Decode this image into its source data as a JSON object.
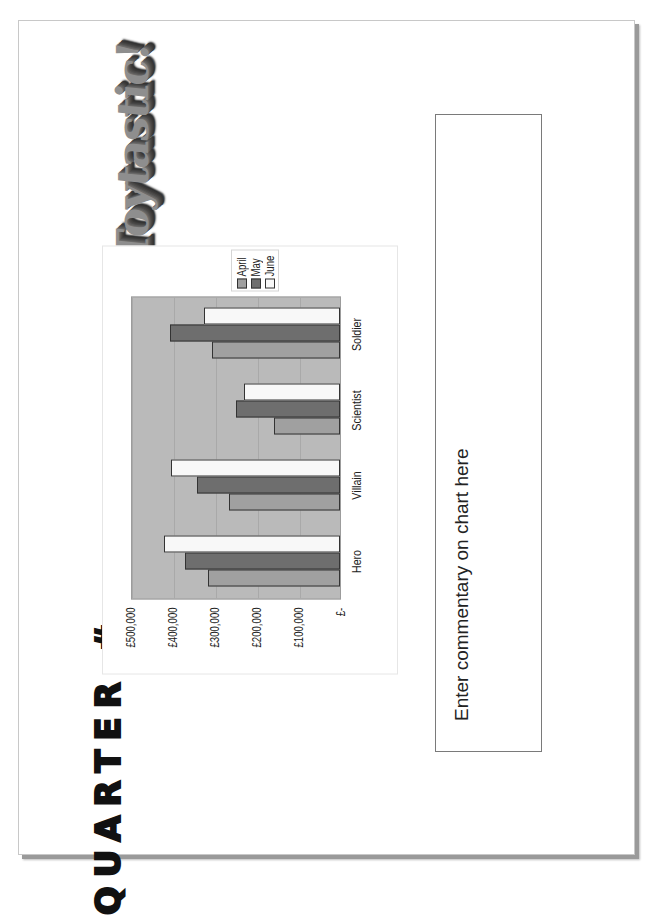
{
  "logo": {
    "text": "Toytastic!"
  },
  "title": {
    "text": "QUARTER #"
  },
  "commentary": {
    "placeholder": "Enter commentary on chart here"
  },
  "colors": {
    "plot_background": "#bababa",
    "april": "#a0a0a0",
    "may": "#6e6e6e",
    "june": "#f8f8f8"
  },
  "chart_data": {
    "type": "bar",
    "orientation": "vertical columns (page rotated 90° counterclockwise)",
    "title": "",
    "xlabel": "",
    "ylabel": "",
    "categories": [
      "Hero",
      "Villain",
      "Scientist",
      "Soldier"
    ],
    "series": [
      {
        "name": "April",
        "values": [
          314000,
          264000,
          157000,
          305000
        ]
      },
      {
        "name": "May",
        "values": [
          369000,
          340000,
          248000,
          405000
        ]
      },
      {
        "name": "June",
        "values": [
          419000,
          402000,
          229000,
          324000
        ]
      }
    ],
    "y_ticks": [
      "£-",
      "£100,000",
      "£200,000",
      "£300,000",
      "£400,000",
      "£500,000"
    ],
    "ylim": [
      0,
      500000
    ],
    "grid": true,
    "legend_position": "right",
    "legend": [
      "April",
      "May",
      "June"
    ]
  }
}
